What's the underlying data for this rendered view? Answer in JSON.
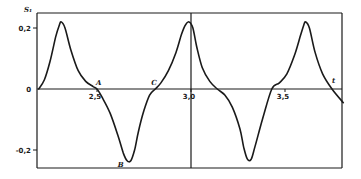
{
  "chart_data": {
    "type": "line",
    "title": "",
    "xlabel": "t",
    "ylabel": "S₁",
    "xlim": [
      2.19,
      3.81
    ],
    "ylim": [
      -0.245,
      0.245
    ],
    "grid": false,
    "legend": null,
    "x_ticks": [
      {
        "value": 2.5,
        "label": "2,5"
      },
      {
        "value": 3.0,
        "label": "3,0"
      },
      {
        "value": 3.5,
        "label": "3,5"
      }
    ],
    "y_ticks": [
      {
        "value": 0.2,
        "label": "0,2"
      },
      {
        "value": 0,
        "label": "0"
      },
      {
        "value": -0.2,
        "label": "-0,2"
      }
    ],
    "annotations": [
      {
        "label": "A",
        "x": 2.5,
        "y": 0.0
      },
      {
        "label": "B",
        "x": 2.68,
        "y": -0.235
      },
      {
        "label": "C",
        "x": 2.81,
        "y": 0.0
      }
    ],
    "series": [
      {
        "name": "S1(t)",
        "x": [
          2.19,
          2.22,
          2.25,
          2.28,
          2.3,
          2.31,
          2.33,
          2.36,
          2.4,
          2.44,
          2.48,
          2.5,
          2.53,
          2.57,
          2.61,
          2.64,
          2.66,
          2.68,
          2.7,
          2.72,
          2.75,
          2.78,
          2.81,
          2.84,
          2.88,
          2.92,
          2.95,
          2.97,
          2.99,
          3.01,
          3.03,
          3.06,
          3.1,
          3.14,
          3.18,
          3.22,
          3.26,
          3.28,
          3.3,
          3.32,
          3.34,
          3.38,
          3.43,
          3.47,
          3.51,
          3.55,
          3.58,
          3.6,
          3.61,
          3.63,
          3.66,
          3.7,
          3.75,
          3.81
        ],
        "y": [
          0.0,
          0.03,
          0.09,
          0.17,
          0.21,
          0.22,
          0.2,
          0.13,
          0.06,
          0.025,
          0.008,
          0.0,
          -0.03,
          -0.08,
          -0.15,
          -0.21,
          -0.235,
          -0.235,
          -0.2,
          -0.14,
          -0.07,
          -0.02,
          0.0,
          0.02,
          0.06,
          0.12,
          0.18,
          0.21,
          0.22,
          0.2,
          0.14,
          0.07,
          0.025,
          0.0,
          -0.02,
          -0.06,
          -0.13,
          -0.19,
          -0.23,
          -0.23,
          -0.19,
          -0.1,
          0.0,
          0.02,
          0.05,
          0.11,
          0.17,
          0.21,
          0.22,
          0.2,
          0.12,
          0.05,
          0.0,
          -0.045
        ]
      }
    ]
  }
}
